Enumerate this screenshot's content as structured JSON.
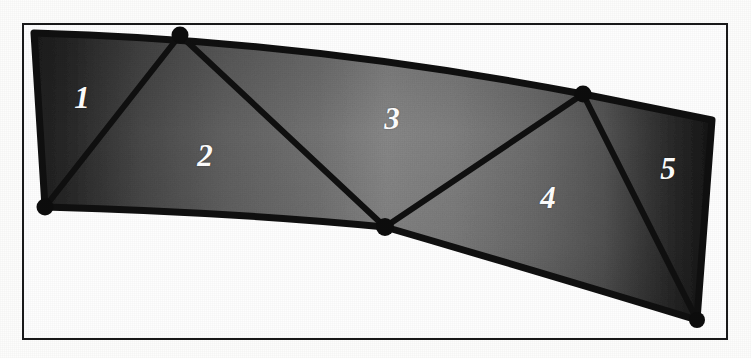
{
  "figure": {
    "canvas": {
      "width": 751,
      "height": 358,
      "background": "#fdfdfc"
    },
    "frame": {
      "name": "figure-border",
      "x": 22,
      "y": 23,
      "width": 706,
      "height": 317,
      "stroke": "#1a1a1a",
      "stroke_width": 2,
      "fill": "#fefefe"
    },
    "patch": {
      "fill_light": "#8d8d8d",
      "fill_dark": "#2a2a2a",
      "outline_color": "#121212",
      "outline_width": 7,
      "top_curve": "M 34 33 Q 300 40 583 94 L 712 120",
      "bottom_curve": "M 45 207 Q 230 212 385 227 Q 560 278 697 320",
      "left_edge": "M 34 33 L 45 207",
      "right_edge": "M 712 120 L 697 320"
    },
    "nodes": [
      {
        "id": "n1",
        "label": "top-left-node",
        "x": 34,
        "y": 33,
        "marker": false
      },
      {
        "id": "n2",
        "label": "top-node",
        "x": 180,
        "y": 35,
        "marker": true
      },
      {
        "id": "n3",
        "label": "bottom-left-node",
        "x": 45,
        "y": 207,
        "marker": true
      },
      {
        "id": "n4",
        "label": "bottom-mid-node",
        "x": 385,
        "y": 227,
        "marker": true
      },
      {
        "id": "n5",
        "label": "upper-right-node",
        "x": 583,
        "y": 94,
        "marker": true
      },
      {
        "id": "n6",
        "label": "top-right-node",
        "x": 712,
        "y": 120,
        "marker": false
      },
      {
        "id": "n7",
        "label": "bottom-right-node",
        "x": 697,
        "y": 320,
        "marker": true
      }
    ],
    "chords": [
      {
        "name": "chord-n3-n2",
        "x1": 45,
        "y1": 207,
        "x2": 180,
        "y2": 35
      },
      {
        "name": "chord-n2-n4",
        "x1": 180,
        "y1": 35,
        "x2": 385,
        "y2": 227
      },
      {
        "name": "chord-n4-n5",
        "x1": 385,
        "y1": 227,
        "x2": 583,
        "y2": 94
      },
      {
        "name": "chord-n5-n7",
        "x1": 583,
        "y1": 94,
        "x2": 697,
        "y2": 320
      }
    ],
    "regions": [
      {
        "id": "region-1",
        "label": "1",
        "cx": 82,
        "cy": 97,
        "shade": "dark"
      },
      {
        "id": "region-2",
        "label": "2",
        "cx": 205,
        "cy": 155,
        "shade": "mid"
      },
      {
        "id": "region-3",
        "label": "3",
        "cx": 392,
        "cy": 118,
        "shade": "light"
      },
      {
        "id": "region-4",
        "label": "4",
        "cx": 548,
        "cy": 197,
        "shade": "mid"
      },
      {
        "id": "region-5",
        "label": "5",
        "cx": 668,
        "cy": 168,
        "shade": "dark"
      }
    ],
    "label_style": {
      "color": "#ffffff",
      "font_size_px": 31,
      "italic": true,
      "bold": true
    }
  }
}
